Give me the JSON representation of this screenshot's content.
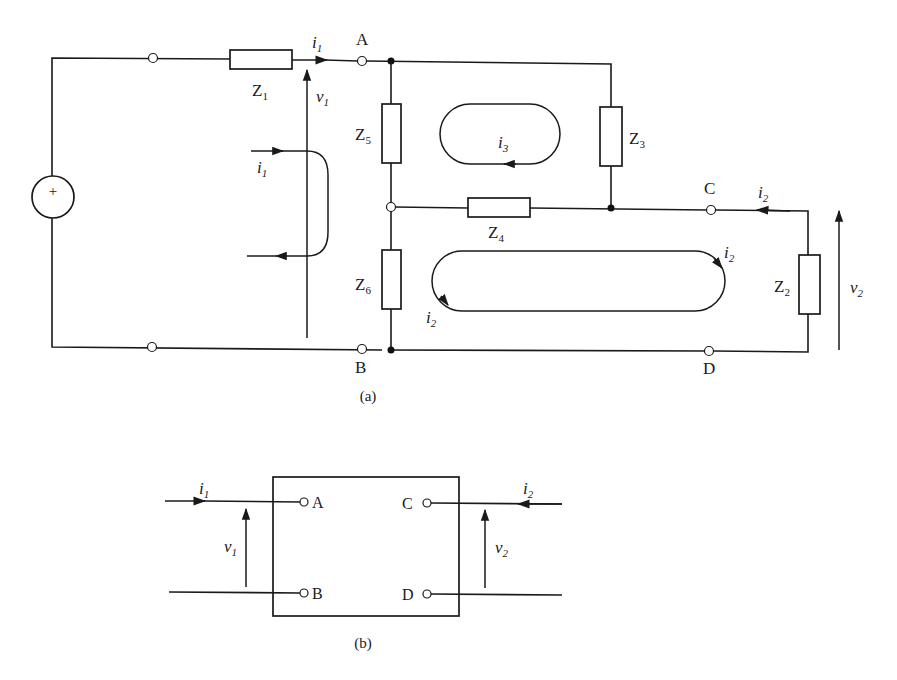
{
  "figure_a": {
    "caption": "(a)",
    "source": {
      "symbol": "+"
    },
    "impedances": [
      {
        "name": "Z",
        "sub": "1"
      },
      {
        "name": "Z",
        "sub": "2"
      },
      {
        "name": "Z",
        "sub": "3"
      },
      {
        "name": "Z",
        "sub": "4"
      },
      {
        "name": "Z",
        "sub": "5"
      },
      {
        "name": "Z",
        "sub": "6"
      }
    ],
    "nodes": {
      "A": "A",
      "B": "B",
      "C": "C",
      "D": "D"
    },
    "currents": {
      "i1_top": {
        "name": "i",
        "sub": "1"
      },
      "i1_loop": {
        "name": "i",
        "sub": "1"
      },
      "i3_loop": {
        "name": "i",
        "sub": "3"
      },
      "i2_top": {
        "name": "i",
        "sub": "2"
      },
      "i2_loop_right": {
        "name": "i",
        "sub": "2"
      },
      "i2_loop_left": {
        "name": "i",
        "sub": "2"
      }
    },
    "voltages": {
      "v1": {
        "name": "v",
        "sub": "1"
      },
      "v2": {
        "name": "v",
        "sub": "2"
      }
    }
  },
  "figure_b": {
    "caption": "(b)",
    "terminals": {
      "A": "A",
      "B": "B",
      "C": "C",
      "D": "D"
    },
    "currents": {
      "i1": {
        "name": "i",
        "sub": "1"
      },
      "i2": {
        "name": "i",
        "sub": "2"
      }
    },
    "voltages": {
      "v1": {
        "name": "v",
        "sub": "1"
      },
      "v2": {
        "name": "v",
        "sub": "2"
      }
    }
  },
  "colors": {
    "ink": "#1a1a1a",
    "background": "#ffffff"
  }
}
